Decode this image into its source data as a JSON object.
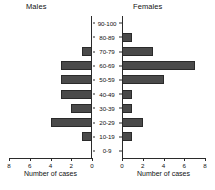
{
  "chart_data": {
    "type": "bar",
    "title": "",
    "subtype": "population-pyramid",
    "orientation": "horizontal",
    "categories": [
      "90-100",
      "80-89",
      "70-79",
      "60-69",
      "50-59",
      "40-49",
      "30-39",
      "20-29",
      "10-19",
      "0-9"
    ],
    "category_axis_label": "",
    "xlabel": "Number of cases",
    "ylabel": "",
    "xlim": [
      0,
      8
    ],
    "xticks": [
      0,
      2,
      4,
      6,
      8
    ],
    "grid": false,
    "legend": null,
    "bar_color": "#4a4a4a",
    "series": [
      {
        "name": "Males",
        "direction": "left",
        "axis_ticks_order": [
          8,
          6,
          4,
          2,
          0
        ],
        "values": [
          0,
          0,
          1,
          3,
          3,
          3,
          2,
          4,
          1,
          0
        ]
      },
      {
        "name": "Females",
        "direction": "right",
        "axis_ticks_order": [
          0,
          2,
          4,
          6,
          8
        ],
        "values": [
          0,
          1,
          3,
          7,
          4,
          1,
          1,
          2,
          1,
          0
        ]
      }
    ]
  },
  "panels": {
    "males": {
      "title": "Males",
      "axis_title": "Number of cases",
      "tick_labels": [
        "8",
        "6",
        "4",
        "2",
        "0"
      ]
    },
    "females": {
      "title": "Females",
      "axis_title": "Number of cases",
      "tick_labels": [
        "0",
        "2",
        "4",
        "6",
        "8"
      ]
    }
  },
  "age_bands": {
    "0": "90-100",
    "1": "80-89",
    "2": "70-79",
    "3": "60-69",
    "4": "50-59",
    "5": "40-49",
    "6": "30-39",
    "7": "20-29",
    "8": "10-19",
    "9": "0-9"
  }
}
